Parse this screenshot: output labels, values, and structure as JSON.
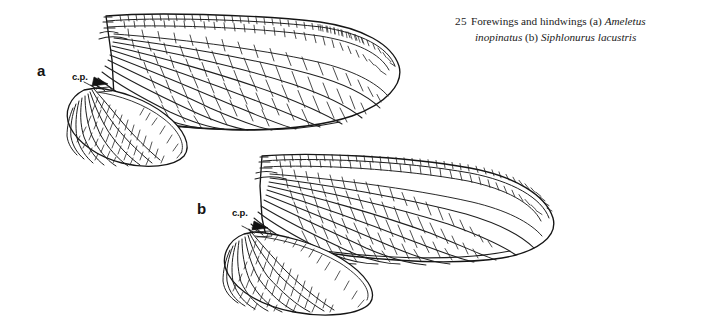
{
  "figure": {
    "number": "25",
    "caption_line1_plain_a": "Forewings and hindwings (a) ",
    "caption_line1_italic": "Ameletus",
    "caption_line2_italic_a": "inopinatus",
    "caption_line2_plain": " (b) ",
    "caption_line2_italic_b": "Siphlonurus lacustris",
    "full_caption": "25 Forewings and hindwings (a) Ameletus inopinatus (b) Siphlonurus lacustris"
  },
  "panels": [
    {
      "id": "a",
      "label": "a",
      "species": "Ameletus inopinatus",
      "annotation": "c.p.",
      "wings": [
        "forewing",
        "hindwing"
      ]
    },
    {
      "id": "b",
      "label": "b",
      "species": "Siphlonurus lacustris",
      "annotation": "c.p.",
      "wings": [
        "forewing",
        "hindwing"
      ]
    }
  ],
  "annotations": {
    "cp_a": "c.p.",
    "cp_b": "c.p."
  },
  "colors": {
    "ink": "#1a1a1a",
    "background": "#ffffff",
    "vein": "#222222"
  }
}
